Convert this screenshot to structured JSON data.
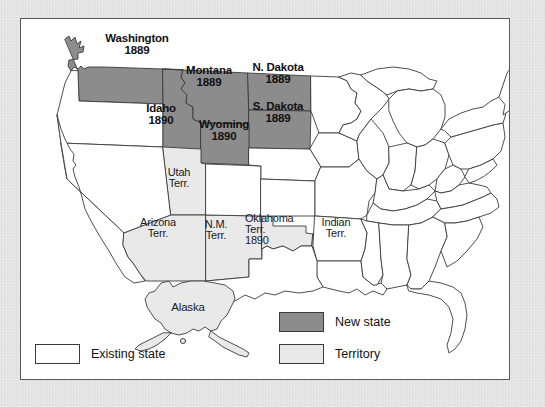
{
  "figure": {
    "kind": "map",
    "colors": {
      "mount": "#d9d9d9",
      "plate": "#ffffff",
      "outline": "#3b3b3b",
      "new_state_fill": "#8c8c8c",
      "territory_fill": "#e9e9e9",
      "existing_state_fill": "#ffffff"
    }
  },
  "regions": {
    "new_states": [
      {
        "name": "Washington",
        "year": "1889",
        "label": "Washington\n1889"
      },
      {
        "name": "Montana",
        "year": "1889",
        "label": "Montana\n1889"
      },
      {
        "name": "N. Dakota",
        "year": "1889",
        "label": "N. Dakota\n1889"
      },
      {
        "name": "S. Dakota",
        "year": "1889",
        "label": "S. Dakota\n1889"
      },
      {
        "name": "Idaho",
        "year": "1890",
        "label": "Idaho\n1890"
      },
      {
        "name": "Wyoming",
        "year": "1890",
        "label": "Wyoming\n1890"
      }
    ],
    "territories": [
      {
        "name": "Utah Terr.",
        "label": "Utah\nTerr."
      },
      {
        "name": "Arizona Terr.",
        "label": "Arizona\nTerr."
      },
      {
        "name": "N.M. Terr.",
        "label": "N.M.\nTerr."
      },
      {
        "name": "Oklahoma Terr.",
        "year": "1890",
        "label": "Oklahoma\nTerr.\n1890"
      },
      {
        "name": "Indian Terr.",
        "label": "Indian\nTerr."
      },
      {
        "name": "Alaska",
        "label": "Alaska"
      }
    ]
  },
  "legend": {
    "items": [
      {
        "key": "existing",
        "label": "Existing state",
        "swatch": "existing-state-swatch"
      },
      {
        "key": "new_state",
        "label": "New state",
        "swatch": "new-state-swatch"
      },
      {
        "key": "territory",
        "label": "Territory",
        "swatch": "territory-swatch"
      }
    ]
  }
}
